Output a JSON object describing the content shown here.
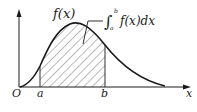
{
  "diagram": {
    "type": "definite-integral-area",
    "labels": {
      "origin": "O",
      "x_axis": "x",
      "a": "a",
      "b": "b",
      "curve": "f(x)",
      "integral_lower": "a",
      "integral_upper": "b",
      "integral_body": "f(x)dx"
    },
    "colors": {
      "stroke": "#1a1a1a",
      "hatch": "#555555",
      "background": "#ffffff"
    }
  }
}
